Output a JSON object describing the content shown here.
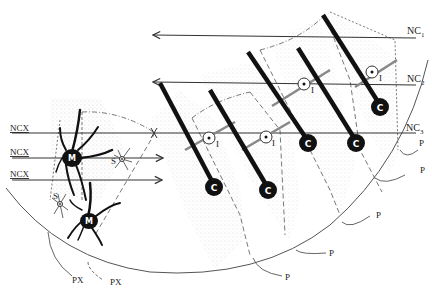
{
  "diagram": {
    "type": "neuroanatomical schematic",
    "fibers": {
      "nc1": {
        "label": "NC",
        "sub": "1"
      },
      "nc2": {
        "label": "NC",
        "sub": "2"
      },
      "nc3": {
        "label": "NC",
        "sub": "3"
      },
      "ncx": [
        "NCX",
        "NCX",
        "NCX"
      ]
    },
    "cell_labels": {
      "c": "C",
      "m": "M",
      "s": "S",
      "i": "I"
    },
    "projection_labels": {
      "p": [
        "P",
        "P",
        "P",
        "P",
        "P"
      ],
      "px": [
        "PX",
        "PX"
      ]
    },
    "colors": {
      "ink": "#111111",
      "line": "#555555",
      "stipple": "#9a9a9a",
      "background": "#ffffff"
    }
  }
}
